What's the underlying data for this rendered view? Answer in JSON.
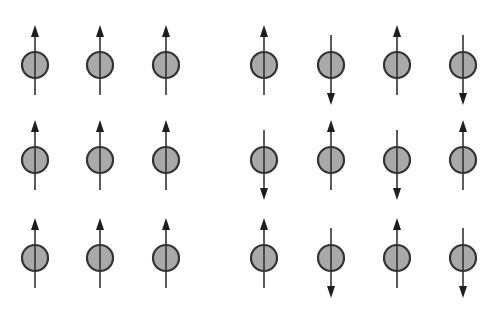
{
  "diagram": {
    "type": "spin-lattice",
    "colors": {
      "atom_fill": "#a9a9a9",
      "atom_stroke": "#333333",
      "arrow": "#1e1e1e",
      "background": "#ffffff"
    },
    "atom_radius": 13,
    "rows_y": [
      65,
      160,
      258
    ],
    "panels": [
      {
        "name": "ferromagnetic",
        "columns_x": [
          35,
          100,
          166
        ],
        "spins": [
          [
            "up",
            "up",
            "up"
          ],
          [
            "up",
            "up",
            "up"
          ],
          [
            "up",
            "up",
            "up"
          ]
        ]
      },
      {
        "name": "antiferromagnetic",
        "columns_x": [
          264,
          331,
          397,
          463
        ],
        "spins": [
          [
            "up",
            "down",
            "up",
            "down"
          ],
          [
            "down",
            "up",
            "down",
            "up"
          ],
          [
            "up",
            "down",
            "up",
            "down"
          ]
        ]
      }
    ]
  }
}
